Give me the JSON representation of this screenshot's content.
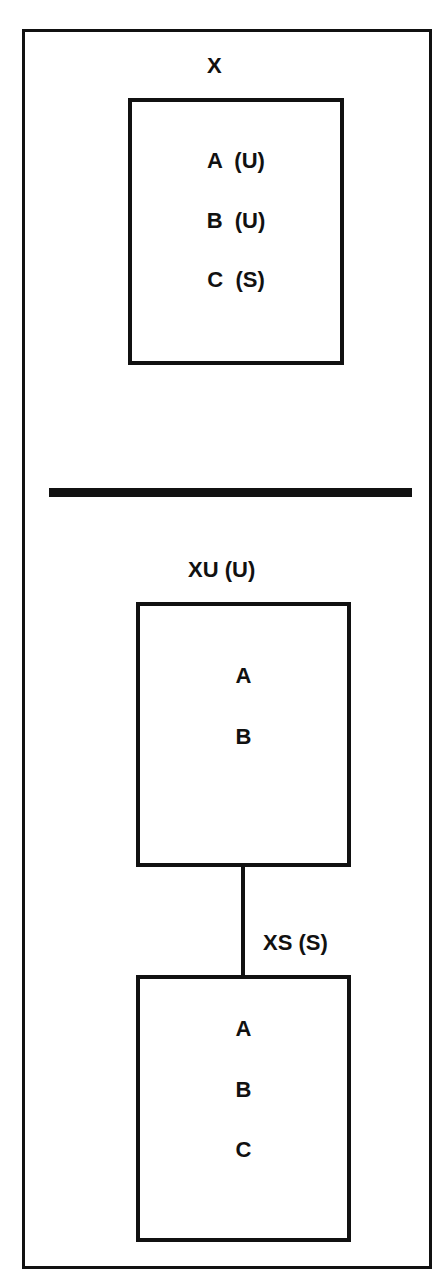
{
  "top_section": {
    "title": "X",
    "box": {
      "items": [
        "A  (U)",
        "B  (U)",
        "C  (S)"
      ]
    }
  },
  "bottom_section": {
    "upper_box": {
      "title": "XU (U)",
      "items": [
        "A",
        "B"
      ]
    },
    "connector_label": "XS (S)",
    "lower_box": {
      "items": [
        "A",
        "B",
        "C"
      ]
    }
  }
}
